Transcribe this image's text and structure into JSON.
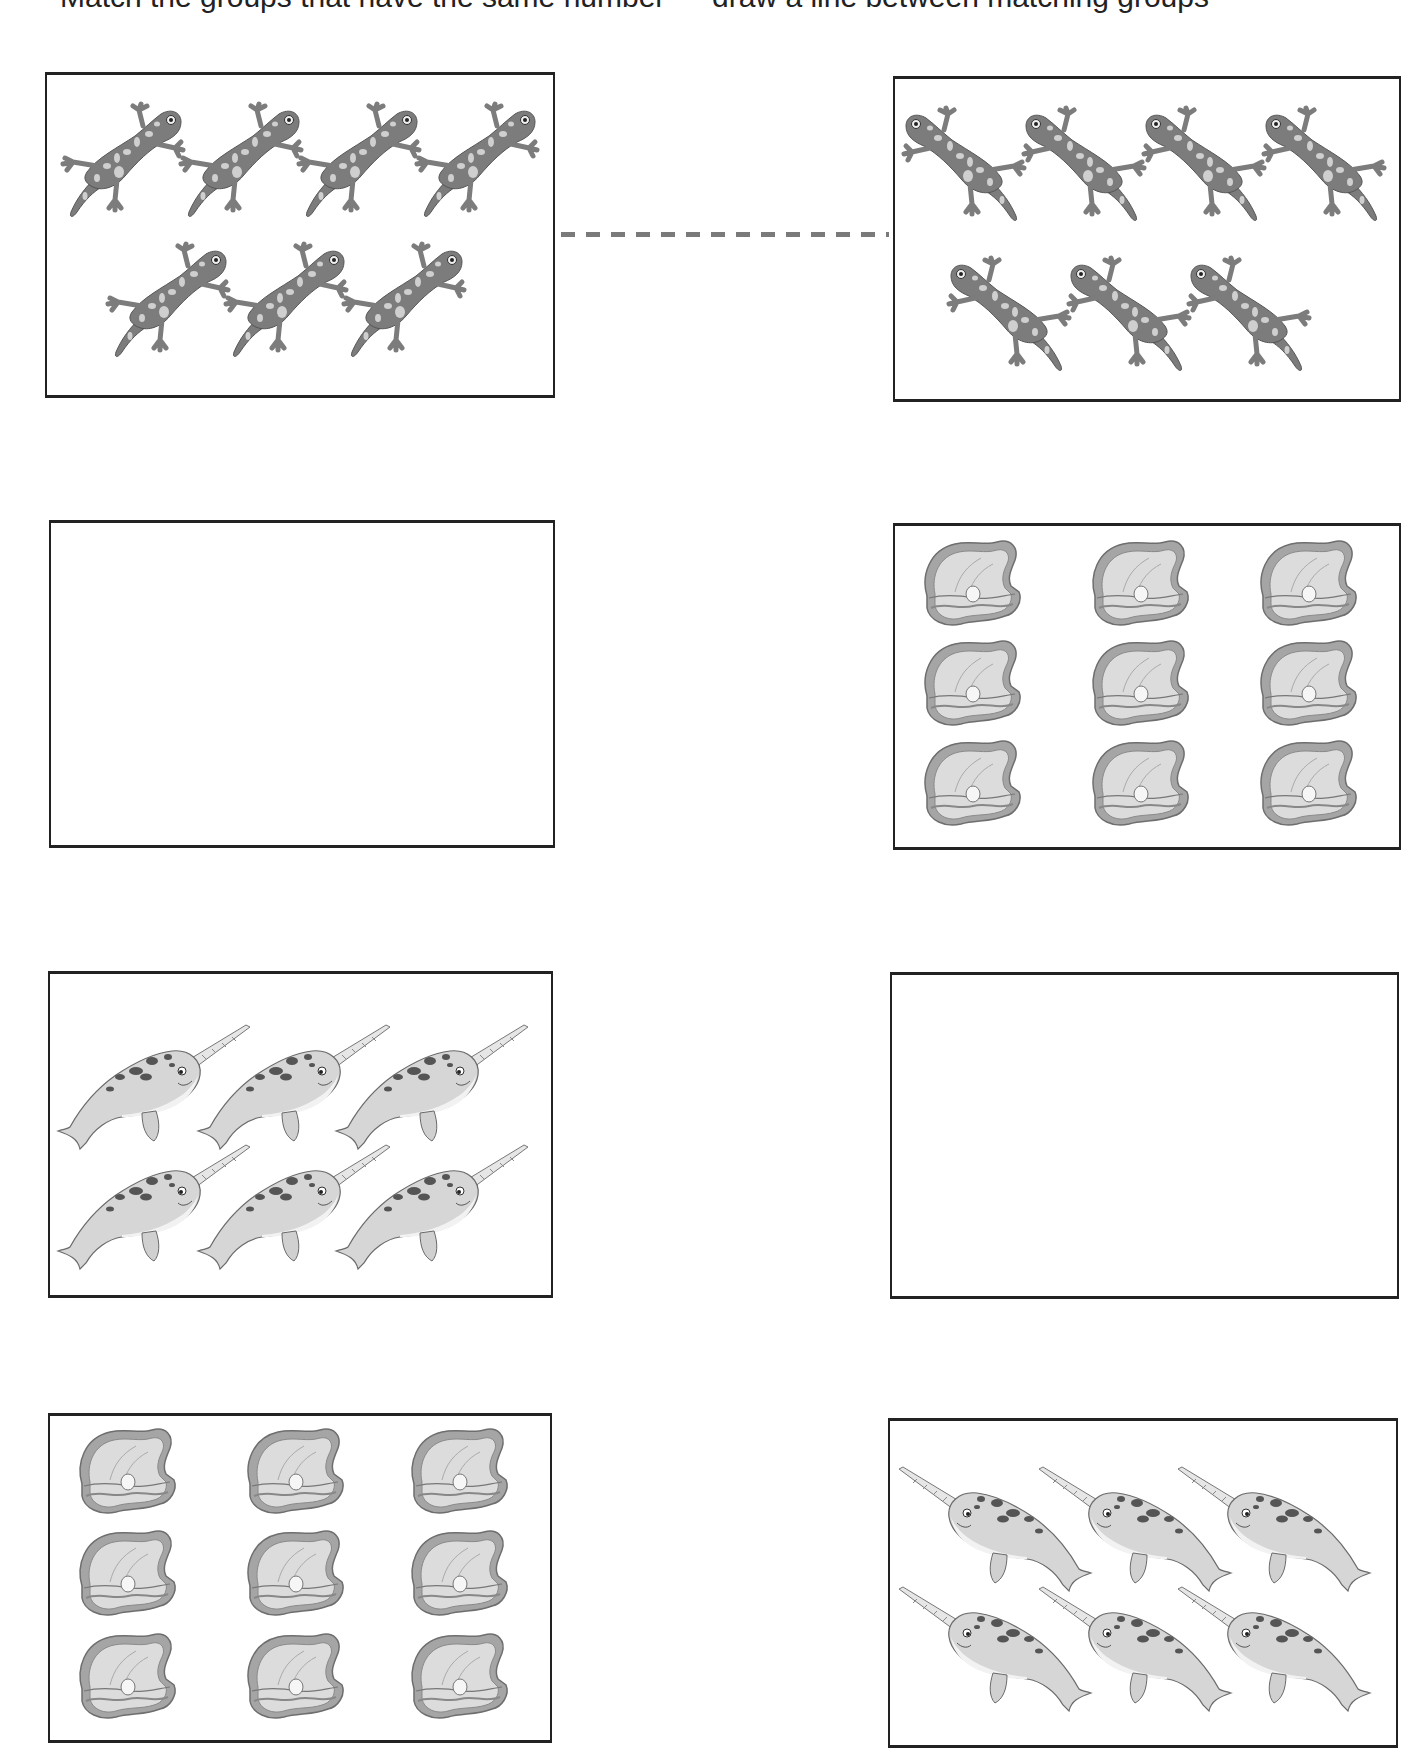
{
  "worksheet": {
    "header_text": "Match the groups that have the same number — draw a line between matching groups",
    "header_note": "header text cropped at top edge; only descenders visible",
    "colors": {
      "border": "#222222",
      "salamander_body": "#7c7c7c",
      "salamander_spots": "#cfcfcf",
      "clam_shell_outer": "#9a9a9a",
      "clam_shell_inner": "#dcdcdc",
      "narwhal_body": "#d6d6d6",
      "narwhal_spots": "#555555",
      "dash_line": "#7a7a7a"
    },
    "connector": {
      "from": "box-left-1",
      "to": "box-right-1",
      "style": "dashed",
      "x1": 561,
      "x2": 889,
      "y": 232
    },
    "boxes": [
      {
        "id": "box-left-1",
        "side": "left",
        "x": 45,
        "y": 72,
        "w": 510,
        "h": 326,
        "icon": "salamander",
        "count": 7,
        "facing": "right",
        "positions": [
          [
            10,
            25
          ],
          [
            128,
            25
          ],
          [
            246,
            25
          ],
          [
            364,
            25
          ],
          [
            55,
            165
          ],
          [
            173,
            165
          ],
          [
            291,
            165
          ]
        ]
      },
      {
        "id": "box-right-1",
        "side": "right",
        "x": 893,
        "y": 76,
        "w": 508,
        "h": 326,
        "icon": "salamander",
        "count": 7,
        "facing": "left",
        "positions": [
          [
            5,
            25
          ],
          [
            125,
            25
          ],
          [
            245,
            25
          ],
          [
            365,
            25
          ],
          [
            50,
            175
          ],
          [
            170,
            175
          ],
          [
            290,
            175
          ]
        ]
      },
      {
        "id": "box-left-2",
        "side": "left",
        "x": 49,
        "y": 520,
        "w": 506,
        "h": 328,
        "icon": "clam",
        "count": 0,
        "positions": []
      },
      {
        "id": "box-right-2",
        "side": "right",
        "x": 893,
        "y": 523,
        "w": 508,
        "h": 327,
        "icon": "clam",
        "count": 9,
        "positions": [
          [
            20,
            10
          ],
          [
            188,
            10
          ],
          [
            356,
            10
          ],
          [
            20,
            110
          ],
          [
            188,
            110
          ],
          [
            356,
            110
          ],
          [
            20,
            210
          ],
          [
            188,
            210
          ],
          [
            356,
            210
          ]
        ]
      },
      {
        "id": "box-left-3",
        "side": "left",
        "x": 48,
        "y": 971,
        "w": 505,
        "h": 327,
        "icon": "narwhal",
        "count": 6,
        "facing": "right",
        "positions": [
          [
            0,
            45
          ],
          [
            140,
            45
          ],
          [
            278,
            45
          ],
          [
            0,
            165
          ],
          [
            140,
            165
          ],
          [
            278,
            165
          ]
        ]
      },
      {
        "id": "box-right-3",
        "side": "right",
        "x": 890,
        "y": 972,
        "w": 509,
        "h": 327,
        "icon": "narwhal",
        "count": 0,
        "positions": []
      },
      {
        "id": "box-left-4",
        "side": "left",
        "x": 48,
        "y": 1413,
        "w": 504,
        "h": 330,
        "icon": "clam",
        "count": 9,
        "positions": [
          [
            20,
            8
          ],
          [
            188,
            8
          ],
          [
            352,
            8
          ],
          [
            20,
            110
          ],
          [
            188,
            110
          ],
          [
            352,
            110
          ],
          [
            20,
            213
          ],
          [
            188,
            213
          ],
          [
            352,
            213
          ]
        ]
      },
      {
        "id": "box-right-4",
        "side": "right",
        "x": 888,
        "y": 1418,
        "w": 510,
        "h": 330,
        "icon": "narwhal",
        "count": 6,
        "facing": "left",
        "positions": [
          [
            4,
            40
          ],
          [
            144,
            40
          ],
          [
            283,
            40
          ],
          [
            4,
            160
          ],
          [
            144,
            160
          ],
          [
            283,
            160
          ]
        ]
      }
    ]
  }
}
